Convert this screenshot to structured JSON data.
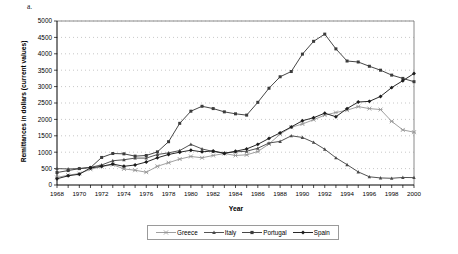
{
  "figure": {
    "label": "a."
  },
  "chart_data": {
    "type": "line",
    "title": "",
    "xlabel": "Year",
    "ylabel": "Remittances in dollars (current values)",
    "xlim": [
      1968,
      2000
    ],
    "ylim": [
      0,
      5000
    ],
    "ytick_step": 500,
    "grid": true,
    "legend_position": "bottom",
    "x": [
      1968,
      1969,
      1970,
      1971,
      1972,
      1973,
      1974,
      1975,
      1976,
      1977,
      1978,
      1979,
      1980,
      1981,
      1982,
      1983,
      1984,
      1985,
      1986,
      1987,
      1988,
      1989,
      1990,
      1991,
      1992,
      1993,
      1994,
      1995,
      1996,
      1997,
      1998,
      1999,
      2000
    ],
    "tick_labels": [
      "1968",
      "1970",
      "1972",
      "1974",
      "1976",
      "1978",
      "1980",
      "1982",
      "1984",
      "1986",
      "1988",
      "1990",
      "1992",
      "1994",
      "1996",
      "1998",
      "2000"
    ],
    "ytick_labels": [
      "0",
      "500",
      "1000",
      "1500",
      "2000",
      "2500",
      "3000",
      "3500",
      "4000",
      "4500",
      "5000"
    ],
    "series": [
      {
        "name": "Greece",
        "color": "#9a9a9a",
        "marker": "star-x",
        "values": [
          230,
          300,
          350,
          480,
          560,
          620,
          490,
          450,
          390,
          570,
          680,
          790,
          870,
          830,
          900,
          960,
          900,
          920,
          1020,
          1250,
          1550,
          1760,
          1860,
          1990,
          2130,
          2210,
          2280,
          2390,
          2330,
          2300,
          1940,
          1680,
          1610
        ]
      },
      {
        "name": "Italy",
        "color": "#4a4a4a",
        "marker": "triangle",
        "values": [
          500,
          490,
          500,
          540,
          610,
          740,
          770,
          820,
          820,
          930,
          980,
          1050,
          1240,
          1100,
          1020,
          980,
          1010,
          1030,
          1120,
          1280,
          1330,
          1500,
          1450,
          1300,
          1090,
          830,
          620,
          400,
          250,
          215,
          205,
          230,
          225
        ]
      },
      {
        "name": "Portugal",
        "color": "#3c3c3c",
        "marker": "square",
        "values": [
          380,
          440,
          500,
          530,
          840,
          960,
          950,
          880,
          900,
          1010,
          1320,
          1880,
          2250,
          2400,
          2330,
          2230,
          2170,
          2130,
          2520,
          2950,
          3300,
          3460,
          3990,
          4380,
          4600,
          4150,
          3780,
          3750,
          3620,
          3500,
          3350,
          3250,
          3150
        ]
      },
      {
        "name": "Spain",
        "color": "#1c1c1c",
        "marker": "diamond",
        "values": [
          190,
          280,
          330,
          520,
          570,
          640,
          570,
          610,
          700,
          830,
          930,
          1000,
          1060,
          1010,
          1040,
          960,
          1030,
          1100,
          1240,
          1420,
          1590,
          1770,
          1960,
          2050,
          2190,
          2080,
          2330,
          2530,
          2550,
          2700,
          2970,
          3180,
          3400
        ]
      }
    ]
  },
  "legend": {
    "items": [
      {
        "label": "Greece"
      },
      {
        "label": "Italy"
      },
      {
        "label": "Portugal"
      },
      {
        "label": "Spain"
      }
    ]
  }
}
